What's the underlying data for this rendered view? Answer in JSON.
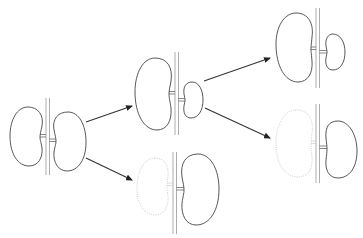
{
  "diagram": {
    "type": "flow",
    "colors": {
      "outline": "#444444",
      "removed_outline": "#c8c8c8",
      "vessel": "#8a8a8a",
      "arrow": "#333333"
    },
    "nodes": [
      {
        "id": "A",
        "left_kidney": "normal",
        "right_kidney": "normal",
        "x": 10,
        "y": 98
      },
      {
        "id": "B",
        "left_kidney": "enlarged",
        "right_kidney": "small",
        "x": 135,
        "y": 53
      },
      {
        "id": "C",
        "left_kidney": "absent",
        "right_kidney": "enlarged",
        "x": 135,
        "y": 150
      },
      {
        "id": "D",
        "left_kidney": "enlarged",
        "right_kidney": "small",
        "x": 275,
        "y": 10
      },
      {
        "id": "E",
        "left_kidney": "absent",
        "right_kidney": "enlarged",
        "x": 275,
        "y": 105
      }
    ],
    "edges": [
      {
        "from": "A",
        "to": "B"
      },
      {
        "from": "A",
        "to": "C"
      },
      {
        "from": "B",
        "to": "D"
      },
      {
        "from": "B",
        "to": "E"
      }
    ]
  }
}
